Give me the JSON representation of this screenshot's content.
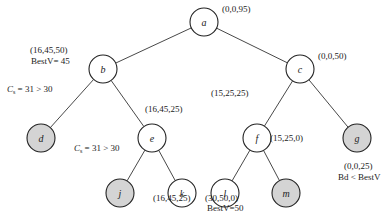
{
  "diagram": {
    "type": "search-tree",
    "colors": {
      "pruned_fill": "#d4d4d4",
      "normal_fill": "#ffffff",
      "stroke": "#222222"
    },
    "nodes": [
      {
        "id": "a",
        "label": "a",
        "x": 204,
        "y": 22,
        "pruned": false
      },
      {
        "id": "b",
        "label": "b",
        "x": 103,
        "y": 69,
        "pruned": false
      },
      {
        "id": "c",
        "label": "c",
        "x": 300,
        "y": 69,
        "pruned": false
      },
      {
        "id": "d",
        "label": "d",
        "x": 41,
        "y": 138,
        "pruned": true
      },
      {
        "id": "e",
        "label": "e",
        "x": 152,
        "y": 138,
        "pruned": false
      },
      {
        "id": "f",
        "label": "f",
        "x": 257,
        "y": 138,
        "pruned": false
      },
      {
        "id": "g",
        "label": "g",
        "x": 357,
        "y": 138,
        "pruned": true
      },
      {
        "id": "j",
        "label": "j",
        "x": 120,
        "y": 193,
        "pruned": true
      },
      {
        "id": "k",
        "label": "k",
        "x": 182,
        "y": 193,
        "pruned": false
      },
      {
        "id": "l",
        "label": "l",
        "x": 225,
        "y": 193,
        "pruned": false
      },
      {
        "id": "m",
        "label": "m",
        "x": 286,
        "y": 193,
        "pruned": true
      }
    ],
    "edges": [
      [
        "a",
        "b"
      ],
      [
        "a",
        "c"
      ],
      [
        "b",
        "d"
      ],
      [
        "b",
        "e"
      ],
      [
        "c",
        "f"
      ],
      [
        "c",
        "g"
      ],
      [
        "e",
        "j"
      ],
      [
        "e",
        "k"
      ],
      [
        "f",
        "l"
      ],
      [
        "f",
        "m"
      ]
    ],
    "annotations": {
      "a_state": "(0,0,95)",
      "b_state": "(16,45,50)",
      "b_best": "BestV= 45",
      "d_prune": "Cs = 31 > 30",
      "e_state": "(16,45,25)",
      "j_prune": "Cs = 31 > 30",
      "k_state": "(16,45,25)",
      "c_state": "(0,0,50)",
      "f_state": "(15,25,25)",
      "m_state": "(15,25,0)",
      "l_state": "(30,50,0)",
      "l_best": "BestV=50",
      "g_state": "(0,0,25)",
      "g_bound": "Bd < BestV"
    }
  }
}
